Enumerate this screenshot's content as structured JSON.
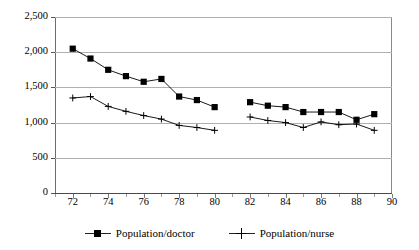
{
  "chart_data": {
    "type": "line",
    "title": "",
    "subtitle": "",
    "xlabel": "",
    "ylabel": "",
    "xlim": [
      71,
      90
    ],
    "ylim": [
      0,
      2500
    ],
    "grid": true,
    "legend_position": "bottom-center",
    "x_ticks": [
      "72",
      "74",
      "76",
      "78",
      "80",
      "82",
      "84",
      "86",
      "88",
      "90"
    ],
    "x_tick_values": [
      72,
      74,
      76,
      78,
      80,
      82,
      84,
      86,
      88,
      90
    ],
    "x_minor_tick_values": [
      71,
      73,
      75,
      77,
      79,
      81,
      83,
      85,
      87,
      89
    ],
    "y_ticks": [
      "0",
      "500",
      "1,000",
      "1,500",
      "2,000",
      "2,500"
    ],
    "y_tick_values": [
      0,
      500,
      1000,
      1500,
      2000,
      2500
    ],
    "series": [
      {
        "name": "Population/doctor",
        "marker": "square",
        "color": "#000000",
        "segments": [
          {
            "x": [
              72,
              73,
              74,
              75,
              76,
              77,
              78,
              79,
              80
            ],
            "values": [
              2050,
              1910,
              1750,
              1660,
              1580,
              1620,
              1370,
              1320,
              1220
            ]
          },
          {
            "x": [
              82,
              83,
              84,
              85,
              86,
              87,
              88,
              89
            ],
            "values": [
              1290,
              1240,
              1220,
              1150,
              1150,
              1150,
              1040,
              1120
            ]
          }
        ]
      },
      {
        "name": "Population/nurse",
        "marker": "plus",
        "color": "#000000",
        "segments": [
          {
            "x": [
              72,
              73,
              74,
              75,
              76,
              77,
              78,
              79,
              80
            ],
            "values": [
              1350,
              1370,
              1230,
              1160,
              1100,
              1050,
              960,
              930,
              890
            ]
          },
          {
            "x": [
              82,
              83,
              84,
              85,
              86,
              87,
              88,
              89
            ],
            "values": [
              1080,
              1030,
              1000,
              930,
              1010,
              970,
              980,
              890
            ]
          }
        ]
      }
    ]
  },
  "legend": {
    "items": [
      {
        "label": "Population/doctor",
        "marker": "square"
      },
      {
        "label": "Population/nurse",
        "marker": "plus"
      }
    ]
  }
}
